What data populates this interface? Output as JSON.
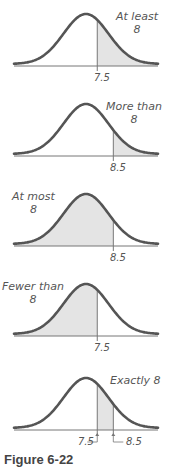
{
  "figure_caption": "Figure 6-22",
  "colors": {
    "curve": "#555555",
    "shade": "#e4e4e4",
    "axis": "#777777",
    "text": "#555555"
  },
  "panels": [
    {
      "label_line1": "At least",
      "label_line2": "8",
      "shade": "right",
      "cut": 7.5,
      "tick_label": "7.5"
    },
    {
      "label_line1": "More than",
      "label_line2": "8",
      "shade": "right",
      "cut": 8.5,
      "tick_label": "8.5"
    },
    {
      "label_line1": "At most",
      "label_line2": "8",
      "shade": "left",
      "cut": 8.5,
      "tick_label": "8.5"
    },
    {
      "label_line1": "Fewer than",
      "label_line2": "8",
      "shade": "left",
      "cut": 7.5,
      "tick_label": "7.5"
    },
    {
      "label_line1": "Exactly 8",
      "label_line2": "",
      "shade": "between",
      "cut": 7.5,
      "cut2": 8.5,
      "tick_label": "7.5",
      "tick_label2": "8.5"
    }
  ],
  "chart_data": {
    "type": "area",
    "title": "Figure 6-22",
    "distribution": "normal",
    "mean": 6.8,
    "sd": 1.4,
    "panels": [
      {
        "label": "At least 8",
        "region": "x >= 7.5",
        "boundaries": [
          7.5
        ]
      },
      {
        "label": "More than 8",
        "region": "x >= 8.5",
        "boundaries": [
          8.5
        ]
      },
      {
        "label": "At most 8",
        "region": "x <= 8.5",
        "boundaries": [
          8.5
        ]
      },
      {
        "label": "Fewer than 8",
        "region": "x <= 7.5",
        "boundaries": [
          7.5
        ]
      },
      {
        "label": "Exactly 8",
        "region": "7.5 <= x <= 8.5",
        "boundaries": [
          7.5,
          8.5
        ]
      }
    ]
  }
}
